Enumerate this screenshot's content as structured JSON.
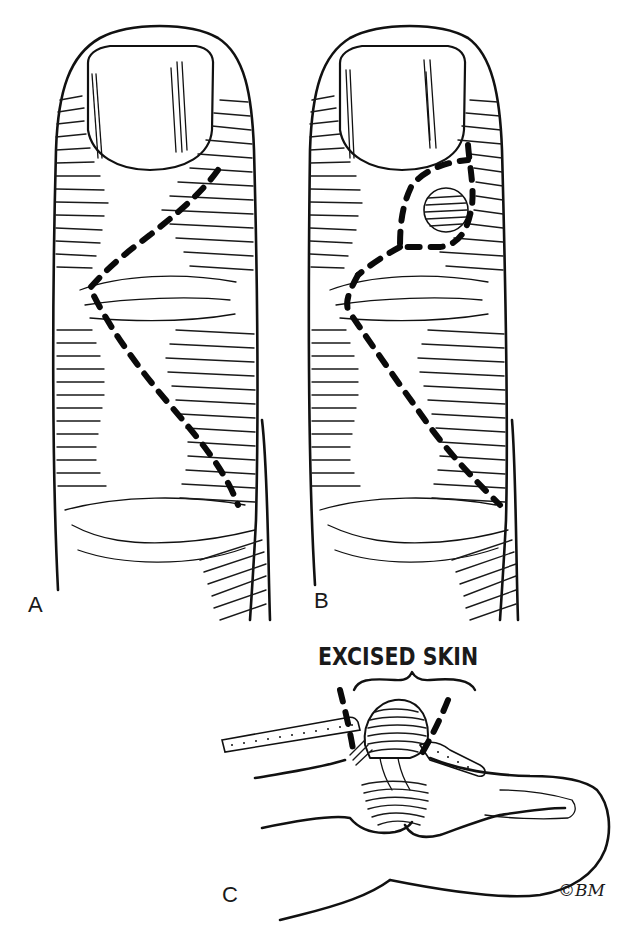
{
  "figure": {
    "panels": [
      {
        "id": "A",
        "label": "A",
        "description": "Dorsal finger view with Z-shaped dashed incision line"
      },
      {
        "id": "B",
        "label": "B",
        "description": "Dorsal finger view with mucous cyst and dashed incision encircling excised skin"
      },
      {
        "id": "C",
        "label": "C",
        "description": "Lateral cross-section of distal finger showing cyst and excised skin"
      }
    ],
    "annotation": {
      "text": "EXCISED SKIN"
    },
    "signature": {
      "text": "©BM"
    },
    "colors": {
      "ink": "#111111",
      "background": "#ffffff"
    }
  }
}
